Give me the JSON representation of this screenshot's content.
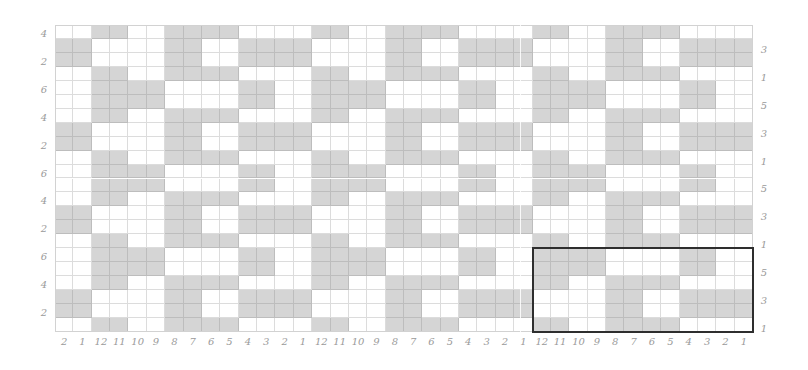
{
  "diagram": {
    "type": "weaving-draft-grid",
    "columns": 38,
    "rows": 22,
    "colors": {
      "filled": "#d5d5d5",
      "empty": "#ffffff",
      "grid_line": "#dcdcdc",
      "label": "#9a9a9a",
      "highlight_border": "#2e2e2e"
    },
    "bottom_labels": [
      "2",
      "1",
      "12",
      "11",
      "10",
      "9",
      "8",
      "7",
      "6",
      "5",
      "4",
      "3",
      "2",
      "1",
      "12",
      "11",
      "10",
      "9",
      "8",
      "7",
      "6",
      "5",
      "4",
      "3",
      "2",
      "1",
      "12",
      "11",
      "10",
      "9",
      "8",
      "7",
      "6",
      "5",
      "4",
      "3",
      "2",
      "1"
    ],
    "left_labels": [
      {
        "row": 0,
        "text": "4"
      },
      {
        "row": 2,
        "text": "2"
      },
      {
        "row": 4,
        "text": "6"
      },
      {
        "row": 6,
        "text": "4"
      },
      {
        "row": 8,
        "text": "2"
      },
      {
        "row": 10,
        "text": "6"
      },
      {
        "row": 12,
        "text": "4"
      },
      {
        "row": 14,
        "text": "2"
      },
      {
        "row": 16,
        "text": "6"
      },
      {
        "row": 18,
        "text": "4"
      },
      {
        "row": 20,
        "text": "2"
      }
    ],
    "right_labels": [
      {
        "row": 1,
        "text": "3"
      },
      {
        "row": 3,
        "text": "1"
      },
      {
        "row": 5,
        "text": "5"
      },
      {
        "row": 7,
        "text": "3"
      },
      {
        "row": 9,
        "text": "1"
      },
      {
        "row": 11,
        "text": "5"
      },
      {
        "row": 13,
        "text": "3"
      },
      {
        "row": 15,
        "text": "1"
      },
      {
        "row": 17,
        "text": "5"
      },
      {
        "row": 19,
        "text": "3"
      },
      {
        "row": 21,
        "text": "1"
      }
    ],
    "grid_rows": [
      "..##..####....##..####....##..####....",
      "##....##..####....##..####....##..####",
      "##....##..####....##..####....##..####",
      "..##..####....##..####....##..####....",
      "..####....##..####....##..####....##..",
      "..####....##..####....##..####....##..",
      "..##..####....##..####....##..####....",
      "##....##..####....##..####....##..####",
      "##....##..####....##..####....##..####",
      "..##..####....##..####....##..####....",
      "..####....##..####....##..####....##..",
      "..####....##..####....##..####....##..",
      "..##..####....##..####....##..####....",
      "##....##..####....##..####....##..####",
      "##....##..####....##..####....##..####",
      "..##..####....##..####....##..####....",
      "..####....##..####....##..####....##..",
      "..####....##..####....##..####....##..",
      "..##..####....##..####....##..####....",
      "##....##..####....##..####....##..####",
      "##....##..####....##..####....##..####",
      "..##..####....##..####....##..####...."
    ],
    "highlight": {
      "col_start": 26,
      "col_end": 37,
      "row_start": 16,
      "row_end": 21
    }
  }
}
